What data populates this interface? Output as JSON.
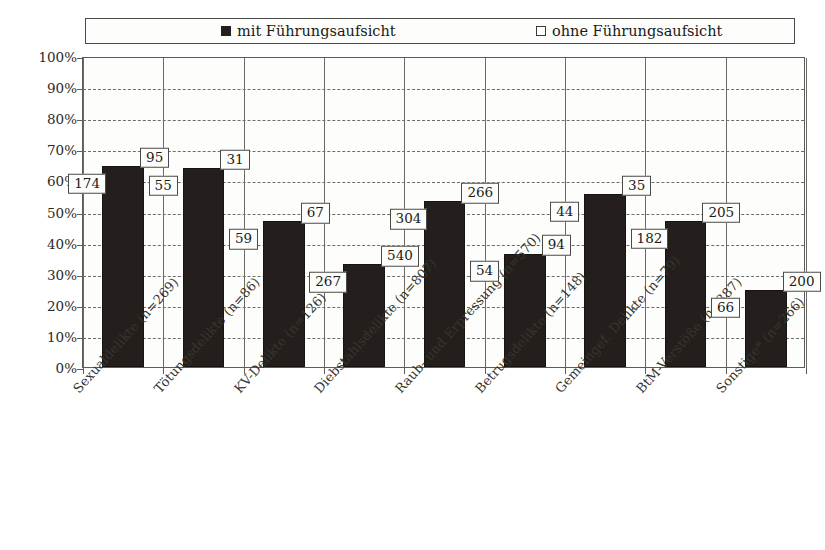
{
  "legend": {
    "entries": [
      {
        "label": "mit Führungsaufsicht",
        "marker": "filled-square-icon",
        "color": "#241f1c"
      },
      {
        "label": "ohne Führungsaufsicht",
        "marker": "hollow-square-icon",
        "color": "#ffffff"
      }
    ]
  },
  "axis": {
    "y_ticks": [
      "0%",
      "10%",
      "20%",
      "30%",
      "40%",
      "50%",
      "60%",
      "70%",
      "80%",
      "90%",
      "100%"
    ]
  },
  "chart_data": {
    "type": "bar",
    "title": "",
    "subtitle": "",
    "xlabel": "",
    "ylabel": "",
    "ylim": [
      0,
      100
    ],
    "ytick_labels": [
      "0%",
      "10%",
      "20%",
      "30%",
      "40%",
      "50%",
      "60%",
      "70%",
      "80%",
      "90%",
      "100%"
    ],
    "grid": true,
    "grid_axis": "y",
    "stacked_to_100_percent": true,
    "legend_position": "top",
    "legend_entries": [
      "mit Führungsaufsicht",
      "ohne Führungsaufsicht"
    ],
    "categories": [
      "Sexualdelikte (n=269)",
      "Tötungsdelikte (n=86)",
      "KV-Delikte (n=126)",
      "Diebstahlsdelikte (n=807)",
      "Raub- und Erpressung (n=570)",
      "Betrugsdelikte (n=148)",
      "Gemeingef. Delikte (n=79)",
      "BtM-Verstöße (n=387)",
      "Sonstige* (n=266)"
    ],
    "category_totals": [
      269,
      86,
      126,
      807,
      570,
      148,
      79,
      387,
      266
    ],
    "series": [
      {
        "name": "mit Führungsaufsicht",
        "counts": [
          174,
          55,
          59,
          267,
          304,
          54,
          44,
          182,
          66
        ],
        "percent": [
          64.7,
          64.0,
          46.8,
          33.1,
          53.3,
          36.5,
          55.7,
          47.0,
          24.8
        ]
      },
      {
        "name": "ohne Führungsaufsicht",
        "counts": [
          95,
          31,
          67,
          540,
          266,
          94,
          35,
          205,
          200
        ],
        "percent": [
          35.3,
          36.0,
          53.2,
          66.9,
          46.7,
          63.5,
          44.3,
          53.0,
          75.2
        ]
      }
    ],
    "annotations": [
      {
        "category": "Sexualdelikte (n=269)",
        "series": "mit Führungsaufsicht",
        "value": 174
      },
      {
        "category": "Sexualdelikte (n=269)",
        "series": "ohne Führungsaufsicht",
        "value": 95
      },
      {
        "category": "Tötungsdelikte (n=86)",
        "series": "mit Führungsaufsicht",
        "value": 55
      },
      {
        "category": "Tötungsdelikte (n=86)",
        "series": "ohne Führungsaufsicht",
        "value": 31
      },
      {
        "category": "KV-Delikte (n=126)",
        "series": "mit Führungsaufsicht",
        "value": 59
      },
      {
        "category": "KV-Delikte (n=126)",
        "series": "ohne Führungsaufsicht",
        "value": 67
      },
      {
        "category": "Diebstahlsdelikte (n=807)",
        "series": "mit Führungsaufsicht",
        "value": 267
      },
      {
        "category": "Diebstahlsdelikte (n=807)",
        "series": "ohne Führungsaufsicht",
        "value": 540
      },
      {
        "category": "Raub- und Erpressung (n=570)",
        "series": "mit Führungsaufsicht",
        "value": 304
      },
      {
        "category": "Raub- und Erpressung (n=570)",
        "series": "ohne Führungsaufsicht",
        "value": 266
      },
      {
        "category": "Betrugsdelikte (n=148)",
        "series": "mit Führungsaufsicht",
        "value": 54
      },
      {
        "category": "Betrugsdelikte (n=148)",
        "series": "ohne Führungsaufsicht",
        "value": 94
      },
      {
        "category": "Gemeingef. Delikte (n=79)",
        "series": "mit Führungsaufsicht",
        "value": 44
      },
      {
        "category": "Gemeingef. Delikte (n=79)",
        "series": "ohne Führungsaufsicht",
        "value": 35
      },
      {
        "category": "BtM-Verstöße (n=387)",
        "series": "mit Führungsaufsicht",
        "value": 182
      },
      {
        "category": "BtM-Verstöße (n=387)",
        "series": "ohne Führungsaufsicht",
        "value": 205
      },
      {
        "category": "Sonstige* (n=266)",
        "series": "mit Führungsaufsicht",
        "value": 66
      },
      {
        "category": "Sonstige* (n=266)",
        "series": "ohne Führungsaufsicht",
        "value": 200
      }
    ]
  }
}
